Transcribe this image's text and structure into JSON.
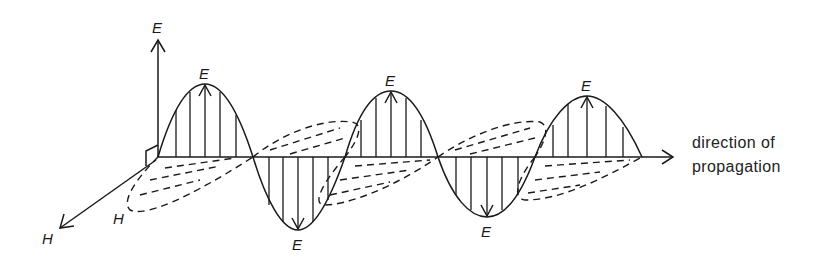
{
  "diagram": {
    "labels": {
      "e_axis": "E",
      "h_axis": "H",
      "h_lobe": "H",
      "e_peak_1": "E",
      "e_trough_1": "E",
      "e_peak_2": "E",
      "e_trough_2": "E",
      "e_peak_3": "E"
    },
    "caption": {
      "line1": "direction of",
      "line2": "propagation"
    },
    "colors": {
      "line": "#1a1a1a",
      "background": "#ffffff"
    }
  }
}
